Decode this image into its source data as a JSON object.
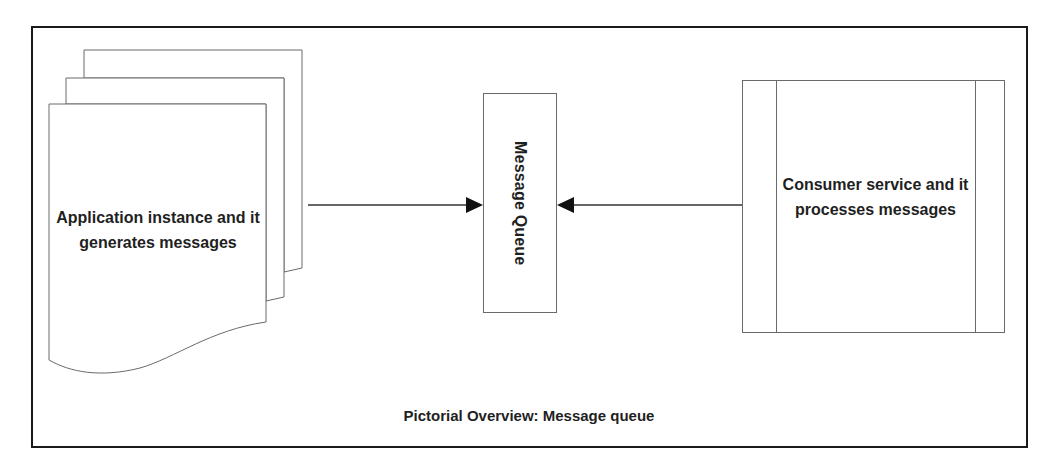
{
  "diagram": {
    "producer": {
      "label": "Application instance and it generates messages",
      "shape": "stacked-documents"
    },
    "queue": {
      "label": "Message Queue",
      "orientation": "vertical"
    },
    "consumer": {
      "label": "Consumer service and it processes messages",
      "shape": "predefined-process"
    },
    "edges": [
      {
        "from": "producer",
        "to": "queue",
        "arrow": "filled-triangle"
      },
      {
        "from": "consumer",
        "to": "queue",
        "arrow": "filled-triangle"
      }
    ],
    "caption": "Pictorial Overview: Message queue",
    "colors": {
      "stroke": "#555555",
      "frame": "#1a1a1a",
      "text": "#1f1f1f",
      "background": "#ffffff"
    }
  }
}
